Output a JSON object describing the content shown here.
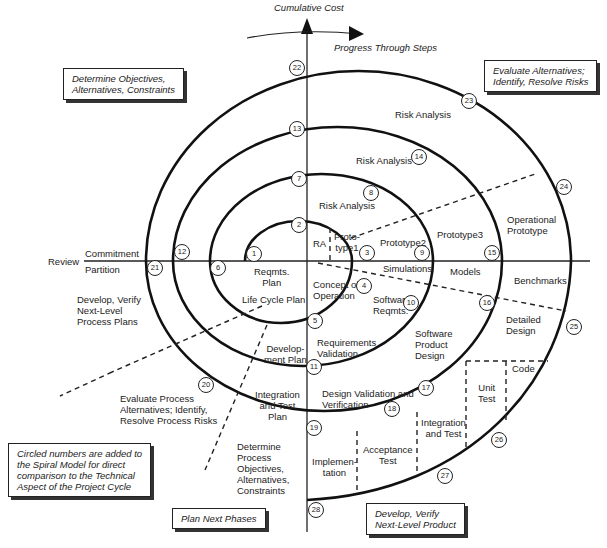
{
  "axes": {
    "vertical_label": "Cumulative Cost",
    "progress_label": "Progress Through Steps",
    "review_label": "Review",
    "commitment_label": "Commitment",
    "partition_label": "Partition"
  },
  "quadrant_boxes": {
    "top_left": "Determine Objectives,\nAlternatives, Constraints",
    "top_right": "Evaluate Alternatives;\nIdentify, Resolve Risks",
    "bottom_left": "Plan Next Phases",
    "bottom_right": "Develop, Verify\nNext-Level Product",
    "note": "Circled numbers are added to\nthe Spiral Model for direct\ncomparison to the Technical\nAspect of the Project Cycle"
  },
  "labels": {
    "risk_analysis_4": "Risk Analysis",
    "risk_analysis_3": "Risk Analysis",
    "risk_analysis_2": "Risk Analysis",
    "ra": "RA",
    "prototype1": "Proto-\ntype1",
    "prototype2": "Prototype2",
    "prototype3": "Prototype3",
    "operational_prototype": "Operational\nPrototype",
    "simulations": "Simulations",
    "models": "Models",
    "benchmarks": "Benchmarks",
    "reqmts_plan": "Reqmts.\nPlan",
    "life_cycle_plan": "Life Cycle Plan",
    "concept_of_operation": "Concept of\nOperation",
    "software_reqmts": "Software\nReqmts.",
    "software_product_design": "Software\nProduct\nDesign",
    "detailed_design": "Detailed\nDesign",
    "code": "Code",
    "unit_test": "Unit\nTest",
    "integration_and_test": "Integration\nand Test",
    "acceptance_test": "Acceptance\nTest",
    "implementation": "Implemen-\ntation",
    "design_validation": "Design Validation and\nVerification",
    "requirements_validation": "Requirements\nValidation",
    "development_plan": "Develop-\nment Plan",
    "integration_test_plan": "Integration\nand Test\nPlan",
    "develop_verify_process": "Develop, Verify\nNext-Level\nProcess Plans",
    "evaluate_process": "Evaluate Process\nAlternatives; Identify,\nResolve Process Risks",
    "determine_process": "Determine\nProcess\nObjectives,\nAlternatives,\nConstraints"
  },
  "circled_numbers": [
    {
      "n": "1",
      "x": 254,
      "y": 254
    },
    {
      "n": "2",
      "x": 299,
      "y": 225
    },
    {
      "n": "3",
      "x": 367,
      "y": 253
    },
    {
      "n": "4",
      "x": 364,
      "y": 286
    },
    {
      "n": "5",
      "x": 315,
      "y": 321
    },
    {
      "n": "6",
      "x": 218,
      "y": 268
    },
    {
      "n": "7",
      "x": 299,
      "y": 179
    },
    {
      "n": "8",
      "x": 371,
      "y": 193
    },
    {
      "n": "9",
      "x": 422,
      "y": 253
    },
    {
      "n": "10",
      "x": 411,
      "y": 303
    },
    {
      "n": "11",
      "x": 314,
      "y": 367
    },
    {
      "n": "12",
      "x": 182,
      "y": 252
    },
    {
      "n": "13",
      "x": 297,
      "y": 129
    },
    {
      "n": "14",
      "x": 419,
      "y": 157
    },
    {
      "n": "15",
      "x": 492,
      "y": 253
    },
    {
      "n": "16",
      "x": 487,
      "y": 303
    },
    {
      "n": "17",
      "x": 426,
      "y": 388
    },
    {
      "n": "18",
      "x": 392,
      "y": 409
    },
    {
      "n": "19",
      "x": 314,
      "y": 428
    },
    {
      "n": "20",
      "x": 206,
      "y": 385
    },
    {
      "n": "21",
      "x": 155,
      "y": 268
    },
    {
      "n": "22",
      "x": 297,
      "y": 68
    },
    {
      "n": "23",
      "x": 469,
      "y": 101
    },
    {
      "n": "24",
      "x": 564,
      "y": 187
    },
    {
      "n": "25",
      "x": 574,
      "y": 327
    },
    {
      "n": "26",
      "x": 499,
      "y": 440
    },
    {
      "n": "27",
      "x": 445,
      "y": 476
    },
    {
      "n": "28",
      "x": 316,
      "y": 510
    }
  ]
}
